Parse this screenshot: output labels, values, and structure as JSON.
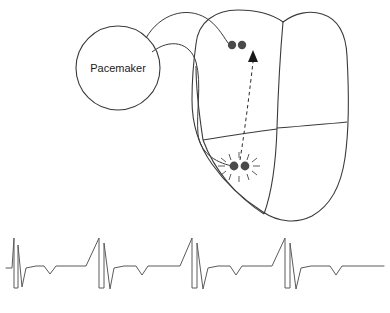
{
  "figure": {
    "background_color": "#ffffff",
    "stroke_color": "#3a3a3a",
    "electrode_color": "#4a4a4a",
    "trace_color": "#5a5a5a"
  },
  "pacemaker": {
    "label": "Pacemaker",
    "shape": "circle",
    "center_x": 118,
    "center_y": 68,
    "radius": 42
  },
  "heart": {
    "label": "heart",
    "chambers": [
      "right atrium",
      "left atrium",
      "right ventricle",
      "left ventricle"
    ]
  },
  "leads": [
    {
      "name": "atrial-lead",
      "from": "pacemaker",
      "to": "atrial-electrode"
    },
    {
      "name": "ventricular-lead",
      "from": "pacemaker",
      "to": "ventricular-electrode"
    }
  ],
  "electrodes": [
    {
      "name": "atrial-electrode",
      "role": "sensing",
      "x": 233,
      "y": 45,
      "spark": false
    },
    {
      "name": "ventricular-electrode",
      "role": "pacing",
      "x": 240,
      "y": 165,
      "spark": true
    }
  ],
  "conduction_arrow": {
    "name": "conduction-arrow",
    "style": "dashed",
    "direction": "from ventricular electrode to atrial electrode",
    "from_x": 240,
    "from_y": 163,
    "to_x": 252,
    "to_y": 57
  },
  "chart_data": {
    "type": "line",
    "title": "",
    "xlabel": "",
    "ylabel": "",
    "grid": false,
    "legend": null,
    "series": [
      {
        "name": "paced ECG",
        "description": "Four paced beats: pacing spike, R wave, S wave, T wave",
        "beats": 4,
        "beat_period": 93,
        "points": [
          [
            6,
            268
          ],
          [
            12,
            268
          ],
          [
            14,
            238
          ],
          [
            14,
            288
          ],
          [
            18,
            288
          ],
          [
            18,
            245
          ],
          [
            22,
            287
          ],
          [
            26,
            268
          ],
          [
            36,
            266
          ],
          [
            44,
            266
          ],
          [
            50,
            274
          ],
          [
            56,
            266
          ],
          [
            78,
            266
          ],
          [
            86,
            266
          ],
          [
            99,
            238
          ],
          [
            99,
            288
          ],
          [
            104,
            288
          ],
          [
            104,
            243
          ],
          [
            110,
            289
          ],
          [
            114,
            268
          ],
          [
            124,
            266
          ],
          [
            136,
            266
          ],
          [
            142,
            275
          ],
          [
            148,
            266
          ],
          [
            172,
            266
          ],
          [
            180,
            266
          ],
          [
            192,
            238
          ],
          [
            192,
            288
          ],
          [
            197,
            288
          ],
          [
            197,
            243
          ],
          [
            203,
            289
          ],
          [
            208,
            268
          ],
          [
            218,
            266
          ],
          [
            230,
            266
          ],
          [
            236,
            275
          ],
          [
            242,
            266
          ],
          [
            264,
            266
          ],
          [
            272,
            266
          ],
          [
            285,
            238
          ],
          [
            285,
            288
          ],
          [
            290,
            288
          ],
          [
            290,
            243
          ],
          [
            296,
            289
          ],
          [
            301,
            268
          ],
          [
            311,
            266
          ],
          [
            330,
            266
          ],
          [
            336,
            275
          ],
          [
            342,
            266
          ],
          [
            384,
            266
          ]
        ],
        "xlim": [
          0,
          390
        ],
        "ylim": [
          288,
          238
        ]
      }
    ]
  }
}
